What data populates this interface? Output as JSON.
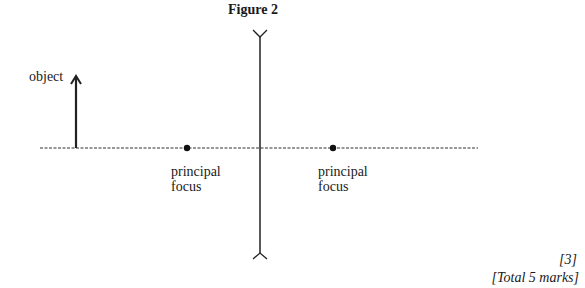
{
  "figure": {
    "title": "Figure 2",
    "object_label": "object",
    "focus_left": [
      "principal",
      "focus"
    ],
    "focus_right": [
      "principal",
      "focus"
    ],
    "lens_type": "diverging-lens-icon"
  },
  "marks": {
    "question_marks": "[3]",
    "total": "[Total 5 marks]"
  }
}
